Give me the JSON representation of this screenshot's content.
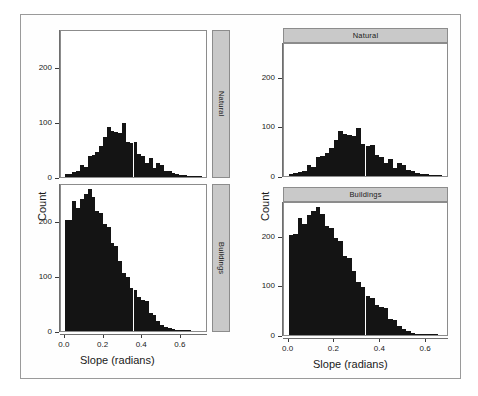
{
  "figure": {
    "background_color": "#ffffff",
    "frame_color": "#9a9a9a",
    "bar_color": "#141414",
    "strip_color": "#c9c9c9"
  },
  "left_figure": {
    "name": "strip-on-right-faceted-histogram",
    "xlabel": "Slope (radians)",
    "ylabel": "Count",
    "strip_position": "right",
    "strips": [
      "Natural",
      "Buildings"
    ]
  },
  "right_figure": {
    "name": "strip-on-top-faceted-histogram",
    "xlabel": "Slope (radians)",
    "ylabel": "Count",
    "strip_position": "top",
    "strips": [
      "Natural",
      "Buildings"
    ]
  },
  "axis": {
    "x_ticks": [
      "0.0",
      "0.2",
      "0.4",
      "0.6"
    ],
    "x_tick_values": [
      0.0,
      0.2,
      0.4,
      0.6
    ],
    "y_ticks": [
      "0",
      "100",
      "200"
    ],
    "y_tick_values": [
      0,
      100,
      200
    ]
  },
  "chart_data": [
    {
      "type": "bar",
      "name": "Natural (left figure, strip right)",
      "title": "Natural",
      "xlabel": "Slope (radians)",
      "ylabel": "Count",
      "xlim": [
        -0.02,
        0.74
      ],
      "ylim": [
        0,
        270
      ],
      "grid": false,
      "legend": "none",
      "bin_width": 0.02,
      "x": [
        0.01,
        0.03,
        0.05,
        0.07,
        0.09,
        0.11,
        0.13,
        0.15,
        0.17,
        0.19,
        0.21,
        0.23,
        0.25,
        0.27,
        0.29,
        0.31,
        0.33,
        0.35,
        0.37,
        0.39,
        0.41,
        0.43,
        0.45,
        0.47,
        0.49,
        0.51,
        0.53,
        0.55,
        0.57,
        0.59,
        0.61,
        0.63,
        0.65,
        0.67,
        0.69,
        0.71
      ],
      "values": [
        5,
        6,
        9,
        11,
        22,
        19,
        39,
        40,
        47,
        57,
        74,
        93,
        85,
        84,
        82,
        99,
        65,
        62,
        64,
        43,
        38,
        26,
        35,
        16,
        26,
        23,
        12,
        11,
        7,
        5,
        4,
        3,
        2,
        2,
        1,
        1
      ]
    },
    {
      "type": "bar",
      "name": "Buildings (left figure, strip right)",
      "title": "Buildings",
      "xlabel": "Slope (radians)",
      "ylabel": "Count",
      "xlim": [
        -0.02,
        0.74
      ],
      "ylim": [
        0,
        270
      ],
      "grid": false,
      "legend": "none",
      "bin_width": 0.02,
      "x": [
        0.01,
        0.03,
        0.05,
        0.07,
        0.09,
        0.11,
        0.13,
        0.15,
        0.17,
        0.19,
        0.21,
        0.23,
        0.25,
        0.27,
        0.29,
        0.31,
        0.33,
        0.35,
        0.37,
        0.39,
        0.41,
        0.43,
        0.45,
        0.47,
        0.49,
        0.51,
        0.53,
        0.55,
        0.57,
        0.59,
        0.61,
        0.63,
        0.65,
        0.67,
        0.69,
        0.71
      ],
      "values": [
        205,
        206,
        240,
        228,
        245,
        253,
        262,
        247,
        222,
        218,
        198,
        193,
        162,
        158,
        130,
        108,
        99,
        80,
        75,
        62,
        57,
        55,
        33,
        30,
        18,
        12,
        8,
        5,
        3,
        2,
        2,
        1,
        1,
        0,
        0,
        0
      ]
    },
    {
      "type": "bar",
      "name": "Natural (right figure, strip top)",
      "title": "Natural",
      "xlabel": "Slope (radians)",
      "ylabel": "Count",
      "xlim": [
        -0.02,
        0.7
      ],
      "ylim": [
        0,
        270
      ],
      "grid": false,
      "legend": "none",
      "bin_width": 0.02,
      "x": [
        0.01,
        0.03,
        0.05,
        0.07,
        0.09,
        0.11,
        0.13,
        0.15,
        0.17,
        0.19,
        0.21,
        0.23,
        0.25,
        0.27,
        0.29,
        0.31,
        0.33,
        0.35,
        0.37,
        0.39,
        0.41,
        0.43,
        0.45,
        0.47,
        0.49,
        0.51,
        0.53,
        0.55,
        0.57,
        0.59,
        0.61,
        0.63,
        0.65,
        0.67
      ],
      "values": [
        5,
        6,
        9,
        11,
        22,
        19,
        39,
        40,
        47,
        57,
        74,
        93,
        85,
        84,
        82,
        99,
        65,
        62,
        64,
        43,
        38,
        26,
        35,
        16,
        26,
        23,
        12,
        11,
        7,
        5,
        4,
        3,
        2,
        1
      ]
    },
    {
      "type": "bar",
      "name": "Buildings (right figure, strip top)",
      "title": "Buildings",
      "xlabel": "Slope (radians)",
      "ylabel": "Count",
      "xlim": [
        -0.02,
        0.7
      ],
      "ylim": [
        0,
        270
      ],
      "grid": false,
      "legend": "none",
      "bin_width": 0.02,
      "x": [
        0.01,
        0.03,
        0.05,
        0.07,
        0.09,
        0.11,
        0.13,
        0.15,
        0.17,
        0.19,
        0.21,
        0.23,
        0.25,
        0.27,
        0.29,
        0.31,
        0.33,
        0.35,
        0.37,
        0.39,
        0.41,
        0.43,
        0.45,
        0.47,
        0.49,
        0.51,
        0.53,
        0.55,
        0.57,
        0.59,
        0.61,
        0.63,
        0.65,
        0.67
      ],
      "values": [
        205,
        206,
        240,
        228,
        245,
        253,
        262,
        247,
        222,
        218,
        198,
        193,
        162,
        158,
        130,
        108,
        99,
        80,
        75,
        62,
        57,
        55,
        33,
        30,
        18,
        12,
        8,
        5,
        3,
        2,
        2,
        1,
        1,
        0
      ]
    }
  ]
}
